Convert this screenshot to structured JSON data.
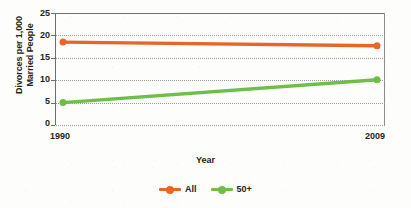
{
  "chart_data": {
    "type": "line",
    "title": "",
    "xlabel": "Year",
    "ylabel_lines": [
      "Divorces per 1,000",
      "Married People"
    ],
    "ylabel": "Divorces per 1,000 Married People",
    "categories": [
      "1990",
      "2009"
    ],
    "x": [
      1990,
      2009
    ],
    "xtick_labels": [
      "1990",
      "2009"
    ],
    "ytick_labels": [
      "0",
      "5",
      "10",
      "15",
      "20",
      "25"
    ],
    "ytick_values": [
      0,
      5,
      10,
      15,
      20,
      25
    ],
    "ylim": [
      0,
      25
    ],
    "grid": "horizontal-dotted",
    "legend_position": "bottom-center",
    "series": [
      {
        "name": "All",
        "color": "#e8652a",
        "values": [
          18.5,
          17.7
        ],
        "marker": "circle"
      },
      {
        "name": "50+",
        "color": "#6fbe4a",
        "values": [
          5.0,
          10.1
        ],
        "marker": "circle"
      }
    ]
  },
  "legend": {
    "items": [
      {
        "label": "All",
        "color": "#e8652a"
      },
      {
        "label": "50+",
        "color": "#6fbe4a"
      }
    ]
  },
  "colors": {
    "all_series": "#e8652a",
    "fifty_plus_series": "#6fbe4a",
    "axis": "#6d6e70",
    "grid": "#9a9b9d",
    "text": "#231f20",
    "background": "#fdfdfb"
  }
}
